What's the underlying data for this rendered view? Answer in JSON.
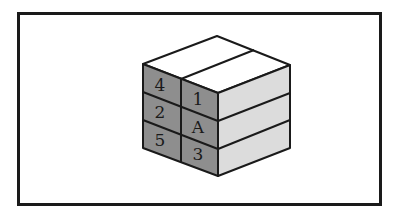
{
  "diagram": {
    "type": "cube-of-blocks",
    "colors": {
      "top_face": "#ffffff",
      "left_face": "#8e8e8e",
      "right_face": "#dcdcdc",
      "edge": "#1a1a1a",
      "frame": "#1a1a1a"
    },
    "left_face_labels": {
      "row1": {
        "col1": "4",
        "col2": "1"
      },
      "row2": {
        "col1": "2",
        "col2": "A"
      },
      "row3": {
        "col1": "5",
        "col2": "3"
      }
    }
  }
}
